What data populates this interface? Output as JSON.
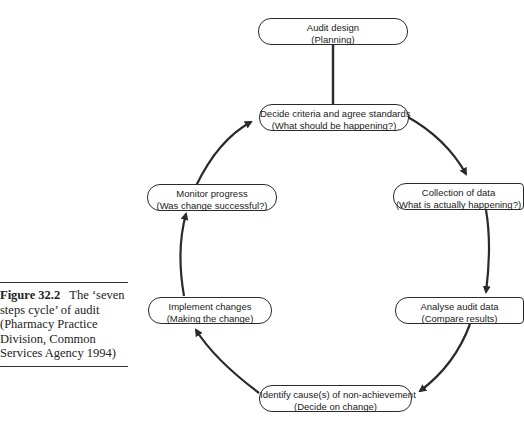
{
  "caption": {
    "label": "Figure 32.2",
    "text": "The ‘seven steps cycle’ of audit (Pharmacy Practice Division, Common Services Agency 1994)"
  },
  "nodes": {
    "audit_design": {
      "title": "Audit design",
      "subtitle": "(Planning)"
    },
    "decide_criteria": {
      "title": "Decide criteria and agree standards",
      "subtitle": "(What should be happening?)"
    },
    "collection": {
      "title": "Collection of data",
      "subtitle": "(What is actually happening?)"
    },
    "analyse": {
      "title": "Analyse audit data",
      "subtitle": "(Compare results)"
    },
    "identify": {
      "title": "Identify cause(s) of non-achievement",
      "subtitle": "(Decide on change)"
    },
    "implement": {
      "title": "Implement changes",
      "subtitle": "(Making the change)"
    },
    "monitor": {
      "title": "Monitor progress",
      "subtitle": "(Was change successful?)"
    }
  },
  "flow": [
    "Audit design -> Decide criteria and agree standards",
    "Decide criteria and agree standards -> Collection of data",
    "Collection of data -> Analyse audit data",
    "Analyse audit data -> Identify cause(s) of non-achievement",
    "Identify cause(s) of non-achievement -> Implement changes",
    "Implement changes -> Monitor progress",
    "Monitor progress -> Decide criteria and agree standards"
  ]
}
